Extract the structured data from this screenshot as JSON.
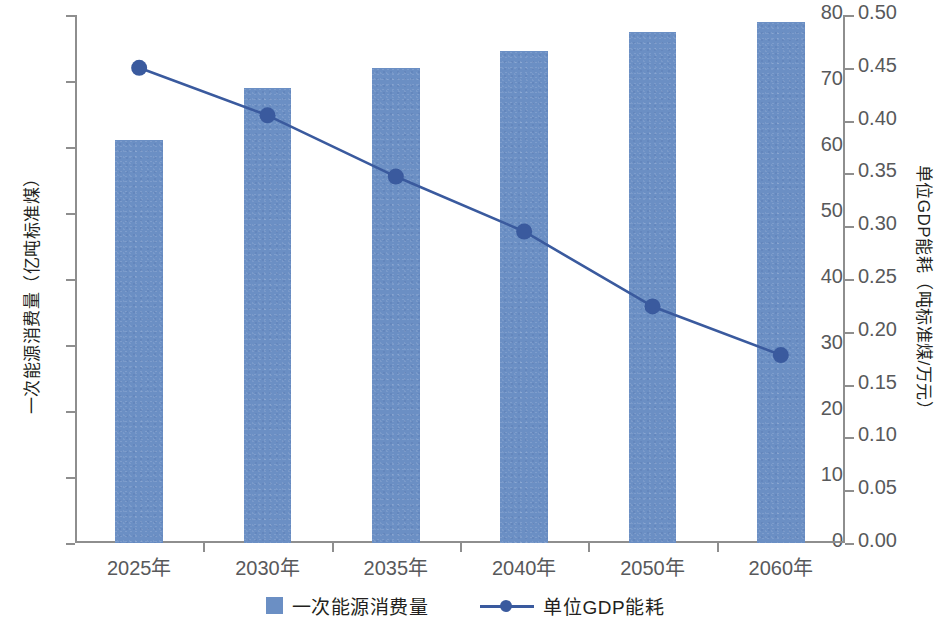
{
  "chart_data": {
    "type": "bar",
    "title": "",
    "subtitle": "",
    "categories": [
      "2025年",
      "2030年",
      "2035年",
      "2040年",
      "2050年",
      "2060年"
    ],
    "series": [
      {
        "name": "一次能源消费量",
        "type": "bar",
        "axis": "left",
        "color": "#6b8fc4",
        "values": [
          61.0,
          69.0,
          72.0,
          74.5,
          77.5,
          79.0
        ]
      },
      {
        "name": "单位GDP能耗",
        "type": "line",
        "axis": "right",
        "color": "#3a5a9e",
        "marker": "circle",
        "values": [
          0.45,
          0.405,
          0.347,
          0.295,
          0.224,
          0.178
        ]
      }
    ],
    "xlabel": "",
    "ylabel": "一次能源消费量（亿吨标准煤）",
    "y2label": "单位GDP能耗（吨标准煤/万元）",
    "ylim": [
      0,
      80
    ],
    "y2lim": [
      0,
      0.5
    ],
    "yticks": [
      0,
      10,
      20,
      30,
      40,
      50,
      60,
      70,
      80
    ],
    "yticklabels": [
      "0",
      "10",
      "20",
      "30",
      "40",
      "50",
      "60",
      "70",
      "80"
    ],
    "y2ticks": [
      0.0,
      0.05,
      0.1,
      0.15,
      0.2,
      0.25,
      0.3,
      0.35,
      0.4,
      0.45,
      0.5
    ],
    "y2ticklabels": [
      "0.00",
      "0.05",
      "0.10",
      "0.15",
      "0.20",
      "0.25",
      "0.30",
      "0.35",
      "0.40",
      "0.45",
      "0.50"
    ],
    "grid": false,
    "legend_position": "bottom-center",
    "legend": [
      "一次能源消费量",
      "单位GDP能耗"
    ]
  },
  "axes": {
    "left_title": "一次能源消费量（亿吨标准煤）",
    "right_title": "单位GDP能耗（吨标准煤/万元）"
  },
  "legend": {
    "items": [
      {
        "label": "一次能源消费量",
        "marker": "square-swatch",
        "color": "#6b8fc4"
      },
      {
        "label": "单位GDP能耗",
        "marker": "line-with-circle",
        "color": "#3a5a9e"
      }
    ]
  },
  "colors": {
    "bar": "#6b8fc4",
    "line": "#3a5a9e",
    "axis": "#8e8e8e",
    "tick_text": "#58595b",
    "title_text": "#231f20",
    "background": "#ffffff"
  }
}
